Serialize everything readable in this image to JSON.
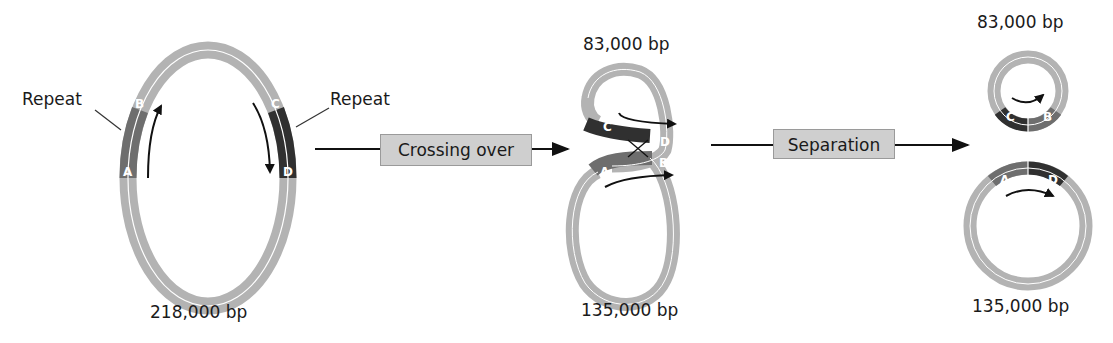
{
  "diagram": {
    "stage1": {
      "size_label": "218,000 bp",
      "repeat_left_label": "Repeat",
      "repeat_right_label": "Repeat",
      "segments": [
        "A",
        "B",
        "C",
        "D"
      ]
    },
    "step1": {
      "label": "Crossing over"
    },
    "stage2": {
      "top_label": "83,000 bp",
      "bottom_label": "135,000 bp",
      "segments": [
        "C",
        "D",
        "A",
        "B"
      ]
    },
    "step2": {
      "label": "Separation"
    },
    "stage3": {
      "small_circle_label": "83,000 bp",
      "large_circle_label": "135,000 bp",
      "small_segments": [
        "C",
        "B"
      ],
      "large_segments": [
        "A",
        "D"
      ]
    },
    "colors": {
      "dna": "#b3b3b3",
      "repeat_ab": "#6e6e6e",
      "repeat_cd": "#303030",
      "box": "#cfcfcf",
      "arrow": "#111111"
    }
  }
}
